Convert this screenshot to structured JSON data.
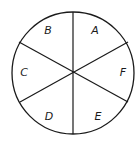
{
  "diagram": {
    "type": "sector-circle",
    "sector_count": 6,
    "stroke_color": "#1a1a1a",
    "background": "#ffffff",
    "labels": {
      "top_left": "B",
      "top_right": "A",
      "left": "C",
      "right": "F",
      "bottom_left": "D",
      "bottom_right": "E"
    }
  }
}
